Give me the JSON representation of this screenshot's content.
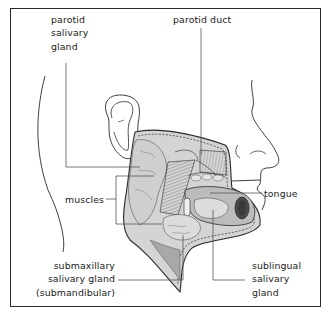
{
  "diagram": {
    "labels": {
      "parotid_gland": "parotid\nsalivary\ngland",
      "parotid_duct": "parotid duct",
      "muscles": "muscles",
      "tongue": "tongue",
      "submaxillary": "submaxillary\nsalivary gland\n(submandibular)",
      "sublingual": "sublingual\nsalivary\ngland"
    },
    "colors": {
      "line": "#2a2a2a",
      "leader": "#555555",
      "gland_fill": "#d4d4d4",
      "muscle_fill": "#a8a8a8",
      "dark_fill": "#4a4a4a",
      "background": "#ffffff"
    }
  }
}
